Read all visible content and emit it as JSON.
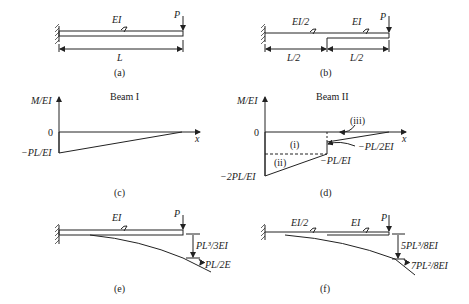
{
  "panels": {
    "a": {
      "caption": "(a)",
      "ei": "EI",
      "load": "P",
      "span": "L"
    },
    "b": {
      "caption": "(b)",
      "ei_left": "EI/2",
      "ei_right": "EI",
      "load": "P",
      "span_left": "L/2",
      "span_right": "L/2"
    },
    "c": {
      "caption": "(c)",
      "title": "Beam I",
      "y_axis": "M/EI",
      "x_axis": "x",
      "zero": "0",
      "min_label": "−PL/EI"
    },
    "d": {
      "caption": "(d)",
      "title": "Beam II",
      "y_axis": "M/EI",
      "x_axis": "x",
      "zero": "0",
      "min_label": "−2PL/EI",
      "mid_label": "−PL/EI",
      "jump_label": "−PL/2EI",
      "region_i": "(i)",
      "region_ii": "(ii)",
      "region_iii": "(iii)"
    },
    "e": {
      "caption": "(e)",
      "ei": "EI",
      "load": "P",
      "deflection": "PL³/3EI",
      "slope": "PL/2E"
    },
    "f": {
      "caption": "(f)",
      "ei_left": "EI/2",
      "ei_right": "EI",
      "load": "P",
      "deflection": "5PL³/8EI",
      "slope": "7PL²/8EI"
    }
  }
}
